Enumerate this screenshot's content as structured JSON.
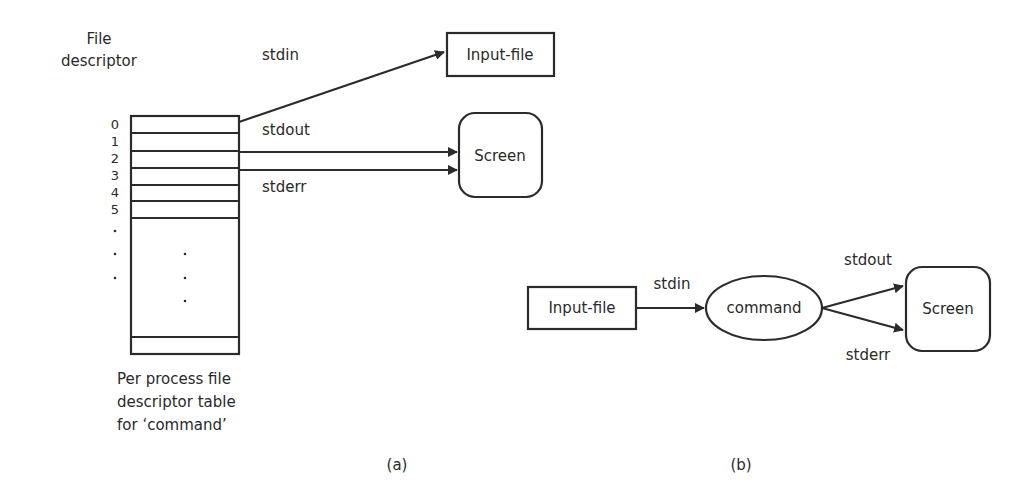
{
  "panel_a": {
    "caption": "(a)",
    "heading_line1": "File",
    "heading_line2": "descriptor",
    "fd_labels": [
      "0",
      "1",
      "2",
      "3",
      "4",
      "5",
      ".",
      ".",
      "."
    ],
    "table_caption_line1": "Per process file",
    "table_caption_line2": "descriptor table",
    "table_caption_line3": "for ‘command’",
    "arrows": {
      "stdin": "stdin",
      "stdout": "stdout",
      "stderr": "stderr"
    },
    "input_file_label": "Input-file",
    "screen_label": "Screen"
  },
  "panel_b": {
    "caption": "(b)",
    "input_file_label": "Input-file",
    "command_label": "command",
    "screen_label": "Screen",
    "arrows": {
      "stdin": "stdin",
      "stdout": "stdout",
      "stderr": "stderr"
    }
  },
  "colors": {
    "stroke": "#2b2b2b",
    "text": "#2a2a2a",
    "background": "#ffffff"
  }
}
